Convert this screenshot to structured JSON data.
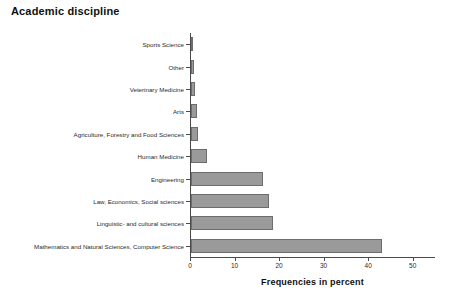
{
  "chart_data": {
    "type": "bar",
    "orientation": "horizontal",
    "title": "Academic discipline",
    "xlabel": "Frequencies in percent",
    "ylabel": "",
    "xlim": [
      0,
      55
    ],
    "xticks": [
      0,
      10,
      20,
      30,
      40,
      50
    ],
    "grid": false,
    "legend": null,
    "bar_color": "#9a9a9a",
    "bar_edge_color": "#6d6d6d",
    "axis_color": "#4a4a4a",
    "categories": [
      "Sports Science",
      "Other",
      "Veterinary Medicine",
      "Arts",
      "Agriculture, Forestry and Food Sciences",
      "Human Medicine",
      "Engineering",
      "Law, Economics, Social sciences",
      "Linguistic- and cultural sciences",
      "Mathematics and Natural Sciences, Computer Science"
    ],
    "values": [
      0.3,
      0.6,
      0.8,
      1.4,
      1.6,
      3.7,
      16.1,
      17.6,
      18.5,
      42.8
    ]
  }
}
